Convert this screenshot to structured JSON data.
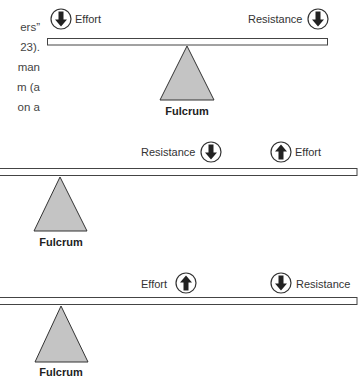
{
  "text_fragment": {
    "lines": [
      "ers”",
      "23).",
      "man",
      "m (a",
      "on a"
    ]
  },
  "levers": [
    {
      "name": "first-class",
      "effort": {
        "label": "Effort",
        "direction": "down",
        "icon": "arrow-down-circle-icon"
      },
      "resistance": {
        "label": "Resistance",
        "direction": "down",
        "icon": "arrow-down-circle-icon"
      },
      "fulcrum": {
        "label": "Fulcrum"
      }
    },
    {
      "name": "second-class",
      "resistance": {
        "label": "Resistance",
        "direction": "down",
        "icon": "arrow-down-circle-icon"
      },
      "effort": {
        "label": "Effort",
        "direction": "up",
        "icon": "arrow-up-circle-icon"
      },
      "fulcrum": {
        "label": "Fulcrum"
      }
    },
    {
      "name": "third-class",
      "effort": {
        "label": "Effort",
        "direction": "up",
        "icon": "arrow-up-circle-icon"
      },
      "resistance": {
        "label": "Resistance",
        "direction": "down",
        "icon": "arrow-down-circle-icon"
      },
      "fulcrum": {
        "label": "Fulcrum"
      }
    }
  ],
  "colors": {
    "fulcrum_fill": "#c4c4c4",
    "stroke": "#333333",
    "beam_fill": "#ffffff",
    "arrow_fill": "#222222"
  }
}
